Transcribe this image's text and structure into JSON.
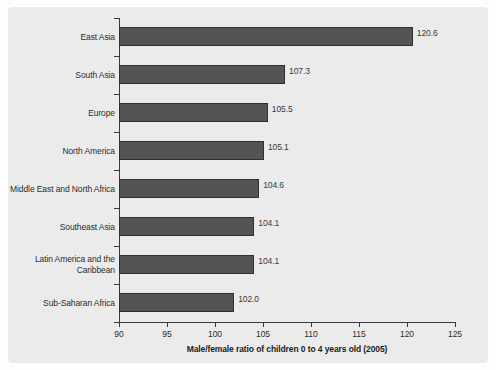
{
  "chart_data": {
    "type": "bar",
    "orientation": "horizontal",
    "title": "",
    "xlabel": "Male/female ratio of children 0 to 4 years old (2005)",
    "ylabel": "",
    "xlim": [
      90,
      125
    ],
    "xticks": [
      90,
      95,
      100,
      105,
      110,
      115,
      120,
      125
    ],
    "grid": false,
    "legend": null,
    "bar_color": "#545454",
    "panel_color": "#ebebeb",
    "categories": [
      "East Asia",
      "South Asia",
      "Europe",
      "North America",
      "Middle East and North Africa",
      "Southeast Asia",
      "Latin America and the\nCaribbean",
      "Sub-Saharan Africa"
    ],
    "values": [
      120.6,
      107.3,
      105.5,
      105.1,
      104.6,
      104.1,
      104.1,
      102.0
    ],
    "value_labels": [
      "120.6",
      "107.3",
      "105.5",
      "105.1",
      "104.6",
      "104.1",
      "104.1",
      "102.0"
    ],
    "bars": [
      {
        "category": "East Asia",
        "category_line1": "East Asia",
        "category_line2": "",
        "value": 120.6,
        "label": "120.6"
      },
      {
        "category": "South Asia",
        "category_line1": "South Asia",
        "category_line2": "",
        "value": 107.3,
        "label": "107.3"
      },
      {
        "category": "Europe",
        "category_line1": "Europe",
        "category_line2": "",
        "value": 105.5,
        "label": "105.5"
      },
      {
        "category": "North America",
        "category_line1": "North America",
        "category_line2": "",
        "value": 105.1,
        "label": "105.1"
      },
      {
        "category": "Middle East and North Africa",
        "category_line1": "Middle East and North Africa",
        "category_line2": "",
        "value": 104.6,
        "label": "104.6"
      },
      {
        "category": "Southeast Asia",
        "category_line1": "Southeast Asia",
        "category_line2": "",
        "value": 104.1,
        "label": "104.1"
      },
      {
        "category": "Latin America and the Caribbean",
        "category_line1": "Latin America and the",
        "category_line2": "Caribbean",
        "value": 104.1,
        "label": "104.1"
      },
      {
        "category": "Sub-Saharan Africa",
        "category_line1": "Sub-Saharan Africa",
        "category_line2": "",
        "value": 102.0,
        "label": "102.0"
      }
    ],
    "xticklabels": [
      "90",
      "95",
      "100",
      "105",
      "110",
      "115",
      "120",
      "125"
    ]
  }
}
